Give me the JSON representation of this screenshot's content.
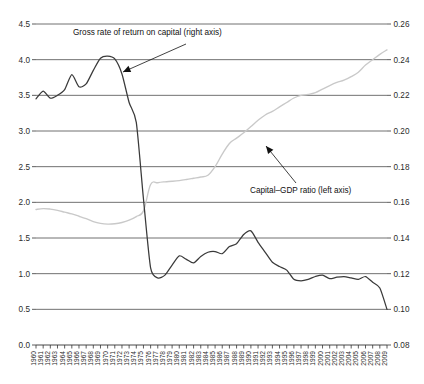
{
  "chart_data": {
    "type": "line",
    "title": "",
    "subtitle": "",
    "xlabel": "",
    "ylabel": "",
    "grid": "horizontal",
    "legend_position": "inline-annotations",
    "x": [
      1960,
      1961,
      1962,
      1963,
      1964,
      1965,
      1966,
      1967,
      1968,
      1969,
      1970,
      1971,
      1972,
      1973,
      1974,
      1975,
      1976,
      1977,
      1978,
      1979,
      1980,
      1981,
      1982,
      1983,
      1984,
      1985,
      1986,
      1987,
      1988,
      1989,
      1990,
      1991,
      1992,
      1993,
      1994,
      1995,
      1996,
      1997,
      1998,
      1999,
      2000,
      2001,
      2002,
      2003,
      2004,
      2005,
      2006,
      2007,
      2008,
      2009
    ],
    "xtick_labels": [
      "1960",
      "1961",
      "1962",
      "1963",
      "1964",
      "1965",
      "1966",
      "1967",
      "1968",
      "1969",
      "1970",
      "1971",
      "1972",
      "1973",
      "1974",
      "1975",
      "1976",
      "1977",
      "1978",
      "1979",
      "1980",
      "1981",
      "1982",
      "1983",
      "1984",
      "1985",
      "1986",
      "1987",
      "1988",
      "1989",
      "1990",
      "1991",
      "1992",
      "1993",
      "1994",
      "1995",
      "1996",
      "1997",
      "1998",
      "1999",
      "2000",
      "2001",
      "2002",
      "2003",
      "2004",
      "2005",
      "2006",
      "2007",
      "2008",
      "2009"
    ],
    "left_axis": {
      "label": "",
      "ylim": [
        0.0,
        4.5
      ],
      "tick_step": 0.5,
      "ticks": [
        "0.0",
        "0.5",
        "1.0",
        "1.5",
        "2.0",
        "2.5",
        "3.0",
        "3.5",
        "4.0",
        "4.5"
      ]
    },
    "right_axis": {
      "label": "",
      "ylim": [
        0.08,
        0.26
      ],
      "tick_step": 0.02,
      "ticks": [
        "0.08",
        "0.10",
        "0.12",
        "0.14",
        "0.16",
        "0.18",
        "0.20",
        "0.22",
        "0.24",
        "0.26"
      ]
    },
    "series": [
      {
        "name": "Gross rate of return on capital",
        "axis": "left",
        "color": "#3a3a3a",
        "annotation": "Gross rate of return on capital (right axis)",
        "values": [
          3.45,
          3.56,
          3.46,
          3.5,
          3.58,
          3.79,
          3.62,
          3.66,
          3.85,
          4.02,
          4.05,
          4.01,
          3.8,
          3.4,
          3.12,
          2.05,
          1.08,
          0.94,
          0.98,
          1.12,
          1.25,
          1.2,
          1.15,
          1.24,
          1.3,
          1.31,
          1.28,
          1.38,
          1.42,
          1.55,
          1.6,
          1.44,
          1.3,
          1.16,
          1.1,
          1.05,
          0.92,
          0.9,
          0.92,
          0.96,
          0.98,
          0.93,
          0.95,
          0.96,
          0.94,
          0.92,
          0.96,
          0.88,
          0.8,
          0.5
        ]
      },
      {
        "name": "Capital-GDP ratio",
        "axis": "right",
        "color": "#c9c9c9",
        "annotation": "Capital–GDP ratio (left axis)",
        "values": [
          0.156,
          0.1565,
          0.1562,
          0.1555,
          0.1545,
          0.1535,
          0.1522,
          0.1508,
          0.1492,
          0.1482,
          0.1478,
          0.148,
          0.1487,
          0.15,
          0.152,
          0.1552,
          0.17,
          0.171,
          0.1715,
          0.1718,
          0.1722,
          0.1728,
          0.1735,
          0.1742,
          0.1752,
          0.18,
          0.187,
          0.193,
          0.196,
          0.199,
          0.2025,
          0.206,
          0.209,
          0.211,
          0.2135,
          0.216,
          0.2185,
          0.22,
          0.2205,
          0.2215,
          0.2235,
          0.2255,
          0.2272,
          0.2285,
          0.2305,
          0.233,
          0.237,
          0.24,
          0.243,
          0.2455
        ]
      }
    ],
    "annotations": [
      {
        "id": "return-annotation",
        "text": "Gross rate of return on capital (right axis)",
        "points_to_year": 1971,
        "points_to_value": 3.65
      },
      {
        "id": "ratio-annotation",
        "text": "Capital–GDP ratio (left axis)",
        "points_to_year": 1985,
        "points_to_value": 0.2015
      }
    ]
  }
}
